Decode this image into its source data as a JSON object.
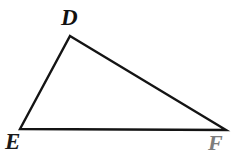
{
  "figure": {
    "type": "triangle",
    "name": "triangle-DEF",
    "background_color": "#ffffff",
    "stroke_color": "#141414",
    "stroke_width": 2.4,
    "width": 241,
    "height": 155
  },
  "vertices": [
    {
      "id": "D",
      "label": "D",
      "x": 70,
      "y": 36,
      "label_x": 61,
      "label_y": 6,
      "label_color": "#111111",
      "label_font_size": 23,
      "label_position": "above"
    },
    {
      "id": "E",
      "label": "E",
      "x": 20,
      "y": 129,
      "label_x": 5,
      "label_y": 130,
      "label_color": "#1a1a1a",
      "label_font_size": 23,
      "label_position": "below-left"
    },
    {
      "id": "F",
      "label": "F",
      "x": 226,
      "y": 130,
      "label_x": 208,
      "label_y": 132,
      "label_color": "#7d7d7d",
      "label_font_size": 22,
      "label_position": "below-right"
    }
  ],
  "edges": [
    {
      "id": "DE",
      "from": "D",
      "to": "E",
      "name": "side-DE"
    },
    {
      "id": "DF",
      "from": "D",
      "to": "F",
      "name": "side-DF"
    },
    {
      "id": "EF",
      "from": "E",
      "to": "F",
      "name": "side-EF"
    }
  ],
  "polygon_points": "70,36 226,130 20,129"
}
